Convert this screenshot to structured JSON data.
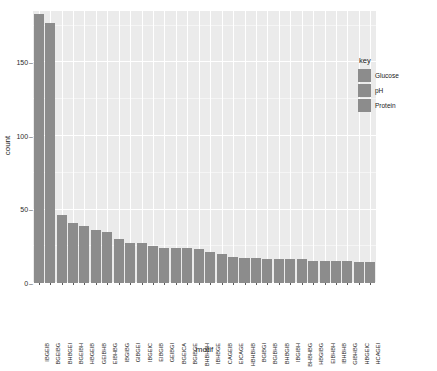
{
  "chart_data": {
    "type": "bar",
    "title": "",
    "xlabel": "motif",
    "ylabel": "count",
    "ylim": [
      0,
      185
    ],
    "yticks": [
      0,
      50,
      100,
      150
    ],
    "grid": true,
    "legend_position": "right",
    "legend_title": "key",
    "legend_entries": [
      "Glucose",
      "pH",
      "Protein"
    ],
    "bar_color": "#8c8c8c",
    "panel_color": "#ebebeb",
    "categories": [
      "IBGEIB",
      "BGEIBG",
      "BHBGEI",
      "BGEIBH",
      "HBGEIB",
      "GEIBHB",
      "EIBHBG",
      "IBGIBG",
      "GIBGEI",
      "IBGEIC",
      "EIBGIB",
      "GEIBGI",
      "BGEICA",
      "BGIBGE",
      "BHBHBH",
      "IBHBGE",
      "CAGEIB",
      "EICAGE",
      "HBHBHB",
      "BGIBGI",
      "BGIBHB",
      "BHBGIB",
      "IBGIBH",
      "BHBHBG",
      "HBGIBG",
      "EIBHBH",
      "IBHBHB",
      "GIBHBG",
      "HBGEIC",
      "HCAGEI"
    ],
    "values": [
      183,
      177,
      46,
      41,
      39,
      36,
      35,
      30,
      27,
      27,
      25,
      24,
      24,
      24,
      23,
      21,
      20,
      18,
      17,
      17,
      16,
      16,
      16,
      16,
      15,
      15,
      15,
      15,
      14,
      14
    ]
  }
}
